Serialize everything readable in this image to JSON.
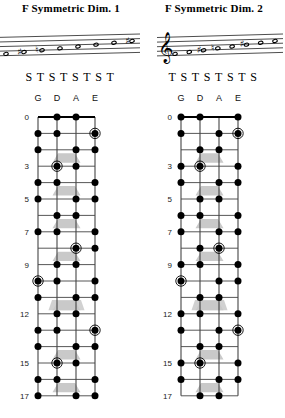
{
  "panels": [
    {
      "title": "F Symmetric Dim. 1",
      "intervals": [
        "S",
        "T",
        "S",
        "T",
        "S",
        "T",
        "S",
        "T"
      ],
      "strings": [
        "G",
        "D",
        "A",
        "E"
      ],
      "clef": "treble-clef",
      "notes": [
        {
          "step": 0,
          "accidental": ""
        },
        {
          "step": 1,
          "accidental": "sharp"
        },
        {
          "step": 2,
          "accidental": "natural"
        },
        {
          "step": 3,
          "accidental": ""
        },
        {
          "step": 4,
          "accidental": ""
        },
        {
          "step": 5,
          "accidental": ""
        },
        {
          "step": 6,
          "accidental": ""
        },
        {
          "step": 7,
          "accidental": "sharp"
        }
      ],
      "fret_labels": [
        "0",
        "3",
        "5",
        "7",
        "9",
        "12",
        "15",
        "17"
      ],
      "dots": [
        {
          "fret": 0,
          "string": 1,
          "root": false
        },
        {
          "fret": 0,
          "string": 2,
          "root": false
        },
        {
          "fret": 1,
          "string": 0,
          "root": false
        },
        {
          "fret": 1,
          "string": 1,
          "root": false
        },
        {
          "fret": 1,
          "string": 3,
          "root": true
        },
        {
          "fret": 2,
          "string": 0,
          "root": false
        },
        {
          "fret": 2,
          "string": 2,
          "root": false
        },
        {
          "fret": 2,
          "string": 3,
          "root": false
        },
        {
          "fret": 3,
          "string": 1,
          "root": true
        },
        {
          "fret": 3,
          "string": 2,
          "root": false
        },
        {
          "fret": 4,
          "string": 0,
          "root": false
        },
        {
          "fret": 4,
          "string": 1,
          "root": false
        },
        {
          "fret": 4,
          "string": 3,
          "root": false
        },
        {
          "fret": 5,
          "string": 0,
          "root": false
        },
        {
          "fret": 5,
          "string": 2,
          "root": false
        },
        {
          "fret": 5,
          "string": 3,
          "root": false
        },
        {
          "fret": 6,
          "string": 1,
          "root": false
        },
        {
          "fret": 6,
          "string": 2,
          "root": false
        },
        {
          "fret": 7,
          "string": 0,
          "root": false
        },
        {
          "fret": 7,
          "string": 1,
          "root": false
        },
        {
          "fret": 7,
          "string": 3,
          "root": false
        },
        {
          "fret": 8,
          "string": 2,
          "root": true
        },
        {
          "fret": 8,
          "string": 3,
          "root": false
        },
        {
          "fret": 9,
          "string": 1,
          "root": false
        },
        {
          "fret": 9,
          "string": 2,
          "root": false
        },
        {
          "fret": 10,
          "string": 0,
          "root": true
        },
        {
          "fret": 10,
          "string": 1,
          "root": false
        },
        {
          "fret": 10,
          "string": 3,
          "root": false
        },
        {
          "fret": 11,
          "string": 0,
          "root": false
        },
        {
          "fret": 11,
          "string": 2,
          "root": false
        },
        {
          "fret": 11,
          "string": 3,
          "root": false
        },
        {
          "fret": 12,
          "string": 1,
          "root": false
        },
        {
          "fret": 12,
          "string": 2,
          "root": false
        },
        {
          "fret": 13,
          "string": 0,
          "root": false
        },
        {
          "fret": 13,
          "string": 1,
          "root": false
        },
        {
          "fret": 13,
          "string": 3,
          "root": true
        },
        {
          "fret": 14,
          "string": 0,
          "root": false
        },
        {
          "fret": 14,
          "string": 2,
          "root": false
        },
        {
          "fret": 14,
          "string": 3,
          "root": false
        },
        {
          "fret": 15,
          "string": 1,
          "root": true
        },
        {
          "fret": 15,
          "string": 2,
          "root": false
        },
        {
          "fret": 16,
          "string": 0,
          "root": false
        },
        {
          "fret": 16,
          "string": 1,
          "root": false
        },
        {
          "fret": 16,
          "string": 3,
          "root": false
        },
        {
          "fret": 17,
          "string": 0,
          "root": false
        },
        {
          "fret": 17,
          "string": 2,
          "root": false
        },
        {
          "fret": 17,
          "string": 3,
          "root": false
        }
      ]
    },
    {
      "title": "F Symmetric Dim. 2",
      "intervals": [
        "T",
        "S",
        "T",
        "S",
        "T",
        "S",
        "T",
        "S"
      ],
      "strings": [
        "G",
        "D",
        "A",
        "E"
      ],
      "clef": "treble-clef",
      "notes": [
        {
          "step": 0,
          "accidental": ""
        },
        {
          "step": 1,
          "accidental": ""
        },
        {
          "step": 2,
          "accidental": "sharp"
        },
        {
          "step": 3,
          "accidental": "natural"
        },
        {
          "step": 4,
          "accidental": ""
        },
        {
          "step": 5,
          "accidental": "sharp"
        },
        {
          "step": 6,
          "accidental": ""
        },
        {
          "step": 7,
          "accidental": ""
        }
      ],
      "fret_labels": [
        "0",
        "3",
        "5",
        "7",
        "9",
        "12",
        "15",
        "17"
      ],
      "dots": [
        {
          "fret": 0,
          "string": 0,
          "root": false
        },
        {
          "fret": 0,
          "string": 1,
          "root": false
        },
        {
          "fret": 0,
          "string": 3,
          "root": false
        },
        {
          "fret": 1,
          "string": 0,
          "root": false
        },
        {
          "fret": 1,
          "string": 2,
          "root": false
        },
        {
          "fret": 1,
          "string": 3,
          "root": true
        },
        {
          "fret": 2,
          "string": 1,
          "root": false
        },
        {
          "fret": 2,
          "string": 2,
          "root": false
        },
        {
          "fret": 3,
          "string": 0,
          "root": false
        },
        {
          "fret": 3,
          "string": 1,
          "root": true
        },
        {
          "fret": 3,
          "string": 3,
          "root": false
        },
        {
          "fret": 4,
          "string": 0,
          "root": false
        },
        {
          "fret": 4,
          "string": 2,
          "root": false
        },
        {
          "fret": 4,
          "string": 3,
          "root": false
        },
        {
          "fret": 5,
          "string": 1,
          "root": false
        },
        {
          "fret": 5,
          "string": 2,
          "root": false
        },
        {
          "fret": 6,
          "string": 0,
          "root": false
        },
        {
          "fret": 6,
          "string": 1,
          "root": false
        },
        {
          "fret": 6,
          "string": 3,
          "root": false
        },
        {
          "fret": 7,
          "string": 0,
          "root": false
        },
        {
          "fret": 7,
          "string": 2,
          "root": false
        },
        {
          "fret": 7,
          "string": 3,
          "root": false
        },
        {
          "fret": 8,
          "string": 1,
          "root": false
        },
        {
          "fret": 8,
          "string": 2,
          "root": true
        },
        {
          "fret": 9,
          "string": 0,
          "root": false
        },
        {
          "fret": 9,
          "string": 1,
          "root": false
        },
        {
          "fret": 9,
          "string": 3,
          "root": false
        },
        {
          "fret": 10,
          "string": 0,
          "root": true
        },
        {
          "fret": 10,
          "string": 2,
          "root": false
        },
        {
          "fret": 10,
          "string": 3,
          "root": false
        },
        {
          "fret": 11,
          "string": 1,
          "root": false
        },
        {
          "fret": 11,
          "string": 2,
          "root": false
        },
        {
          "fret": 12,
          "string": 0,
          "root": false
        },
        {
          "fret": 12,
          "string": 1,
          "root": false
        },
        {
          "fret": 12,
          "string": 3,
          "root": false
        },
        {
          "fret": 13,
          "string": 0,
          "root": false
        },
        {
          "fret": 13,
          "string": 2,
          "root": false
        },
        {
          "fret": 13,
          "string": 3,
          "root": true
        },
        {
          "fret": 14,
          "string": 1,
          "root": false
        },
        {
          "fret": 14,
          "string": 2,
          "root": false
        },
        {
          "fret": 15,
          "string": 0,
          "root": false
        },
        {
          "fret": 15,
          "string": 1,
          "root": true
        },
        {
          "fret": 15,
          "string": 3,
          "root": false
        },
        {
          "fret": 16,
          "string": 0,
          "root": false
        },
        {
          "fret": 16,
          "string": 2,
          "root": false
        },
        {
          "fret": 16,
          "string": 3,
          "root": false
        },
        {
          "fret": 17,
          "string": 1,
          "root": false
        },
        {
          "fret": 17,
          "string": 2,
          "root": false
        }
      ]
    }
  ],
  "style": {
    "ink": "#000000",
    "grid": "#444444",
    "marker_fill": "#c9c9c9",
    "fretnum_color": "#1a1a1a"
  },
  "board_geometry": {
    "inlay_frets": [
      2,
      4,
      6,
      8,
      11,
      14,
      16
    ],
    "double_inlay_frets": [
      11
    ],
    "total_frets": 17,
    "string_count": 4
  }
}
